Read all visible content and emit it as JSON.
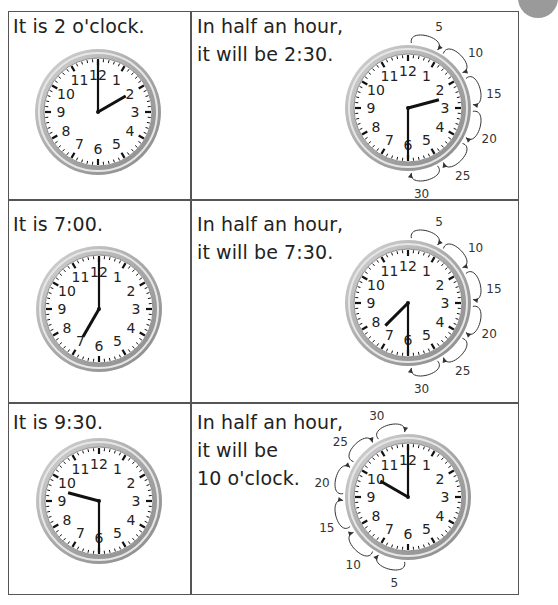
{
  "rows": [
    {
      "left_text": "It is 2 o'clock.",
      "left_clock": {
        "hour": 2,
        "minute": 0
      },
      "right_text_lines": [
        "In half an hour,",
        "it will be 2:30."
      ],
      "right_clock": {
        "hour": 2,
        "minute": 30
      },
      "skip_labels": [
        "5",
        "10",
        "15",
        "20",
        "25",
        "30"
      ],
      "skip_direction": "clockwise-right"
    },
    {
      "left_text": "It is 7:00.",
      "left_clock": {
        "hour": 7,
        "minute": 0
      },
      "right_text_lines": [
        "In half an hour,",
        "it will be 7:30."
      ],
      "right_clock": {
        "hour": 7,
        "minute": 30
      },
      "skip_labels": [
        "5",
        "10",
        "15",
        "20",
        "25",
        "30"
      ],
      "skip_direction": "clockwise-right"
    },
    {
      "left_text": "It is 9:30.",
      "left_clock": {
        "hour": 9,
        "minute": 30
      },
      "right_text_lines": [
        "In half an hour,",
        "it will be",
        "10 o'clock."
      ],
      "right_clock": {
        "hour": 10,
        "minute": 0
      },
      "skip_labels": [
        "5",
        "10",
        "15",
        "20",
        "25",
        "30"
      ],
      "skip_direction": "clockwise-left"
    }
  ],
  "clock_face_numbers": [
    "12",
    "1",
    "2",
    "3",
    "4",
    "5",
    "6",
    "7",
    "8",
    "9",
    "10",
    "11"
  ],
  "colors": {
    "border": "#555555",
    "rim": "#a8a8a8",
    "hands": "#111111",
    "text": "#222222"
  }
}
